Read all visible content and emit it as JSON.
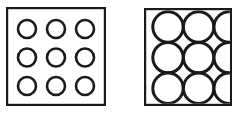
{
  "figure": {
    "canvas": {
      "width": 234,
      "height": 117
    },
    "background_color": "#ffffff",
    "stroke_color": "#1a1a1a",
    "fill_color": "#ffffff",
    "panels": [
      {
        "id": "left-panel",
        "name": "small-circles-square",
        "label": "",
        "square": {
          "x": 6,
          "y": 7,
          "width": 100,
          "height": 99,
          "stroke_width": 2.2,
          "fill": "#ffffff"
        },
        "grid": {
          "rows": 3,
          "cols": 3,
          "count": 9,
          "circle_radius": 9,
          "circle_stroke_width": 2.6,
          "center_spacing_x": 29,
          "center_spacing_y": 28.5,
          "first_center_x": 27,
          "first_center_y": 29,
          "circles_touch": false
        }
      },
      {
        "id": "right-panel",
        "name": "large-circles-square",
        "label": "",
        "square": {
          "x": 144,
          "y": 8,
          "width": 88,
          "height": 98,
          "stroke_width": 2.2,
          "fill": "#ffffff",
          "clipped_at_image_edge": true
        },
        "grid": {
          "rows": 3,
          "cols": 3,
          "count": 9,
          "circle_radius": 15.2,
          "circle_stroke_width": 3.0,
          "center_spacing_x": 30.6,
          "center_spacing_y": 30.6,
          "first_center_x": 168,
          "first_center_y": 27,
          "circles_touch": true
        }
      }
    ]
  },
  "chart_data": {
    "type": "diagram",
    "categories": [
      "small circles in square",
      "large circles in square"
    ],
    "values": [
      9,
      9
    ],
    "series": [
      {
        "name": "circle count",
        "values": [
          9,
          9
        ]
      },
      {
        "name": "circle diameter (px)",
        "values": [
          18,
          30
        ]
      },
      {
        "name": "square side (px)",
        "values": [
          100,
          98
        ]
      }
    ],
    "xlabel": "",
    "ylabel": "",
    "annotations": [
      "Left square: 3x3 arrangement of nine small circles, clearly separated, large white margins.",
      "Right square: 3x3 arrangement of nine large circles, mutually tangent, filling the square; right column clipped by image border."
    ],
    "legend_position": "none",
    "grid": false
  }
}
